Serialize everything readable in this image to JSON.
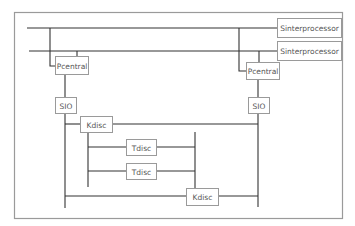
{
  "diagram": {
    "type": "block-diagram",
    "nodes": {
      "sinterprocessor_1": {
        "label": "Sinterprocessor"
      },
      "sinterprocessor_2": {
        "label": "Sinterprocessor"
      },
      "pcentral_left": {
        "label": "Pcentral"
      },
      "pcentral_right": {
        "label": "Pcentral"
      },
      "sio_left": {
        "label": "SIO"
      },
      "sio_right": {
        "label": "SIO"
      },
      "kdisc_top": {
        "label": "Kdisc"
      },
      "kdisc_bottom": {
        "label": "Kdisc"
      },
      "tdisc_1": {
        "label": "Tdisc"
      },
      "tdisc_2": {
        "label": "Tdisc"
      }
    },
    "edges": [
      {
        "from": "bus_1",
        "to": "sinterprocessor_1"
      },
      {
        "from": "bus_2",
        "to": "sinterprocessor_2"
      },
      {
        "from": "bus_1",
        "to": "pcentral_left"
      },
      {
        "from": "bus_2",
        "to": "pcentral_left"
      },
      {
        "from": "bus_1",
        "to": "pcentral_right"
      },
      {
        "from": "bus_2",
        "to": "pcentral_right"
      },
      {
        "from": "pcentral_left",
        "to": "sio_left"
      },
      {
        "from": "pcentral_right",
        "to": "sio_right"
      },
      {
        "from": "sio_left",
        "to": "kdisc_top"
      },
      {
        "from": "kdisc_top",
        "to": "sio_right"
      },
      {
        "from": "kdisc_top",
        "to": "tdisc_1"
      },
      {
        "from": "kdisc_top",
        "to": "tdisc_2"
      },
      {
        "from": "tdisc_1",
        "to": "kdisc_bottom"
      },
      {
        "from": "tdisc_2",
        "to": "kdisc_bottom"
      },
      {
        "from": "sio_left",
        "to": "kdisc_bottom"
      },
      {
        "from": "kdisc_bottom",
        "to": "sio_right"
      }
    ]
  }
}
